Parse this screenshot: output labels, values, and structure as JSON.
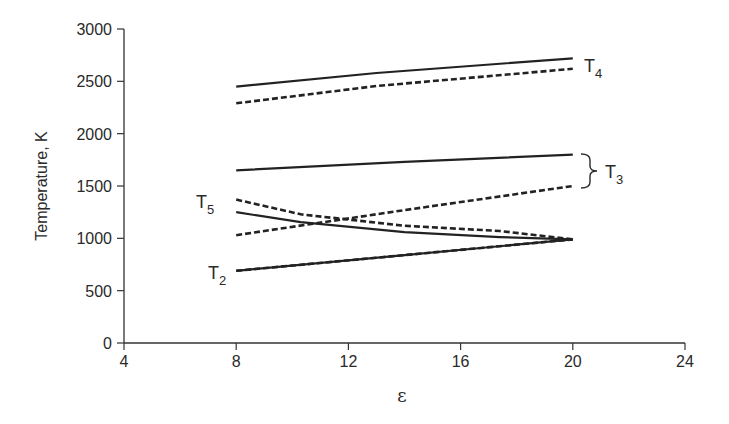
{
  "chart_data": {
    "type": "line",
    "title": "",
    "xlabel": "ε",
    "ylabel": "Temperature, K",
    "xlim": [
      4,
      24
    ],
    "ylim": [
      0,
      3000
    ],
    "xticks": [
      4,
      8,
      12,
      16,
      20,
      24
    ],
    "yticks": [
      0,
      500,
      1000,
      1500,
      2000,
      2500,
      3000
    ],
    "grid": false,
    "legend": "inline labels",
    "series": [
      {
        "name": "T4 (solid)",
        "label": "T",
        "subscript": "4",
        "style": "solid",
        "x": [
          8,
          13,
          20
        ],
        "y": [
          2450,
          2580,
          2720
        ]
      },
      {
        "name": "T4 (dashed)",
        "label": "T",
        "subscript": "4",
        "style": "dashed",
        "x": [
          8,
          13,
          20
        ],
        "y": [
          2290,
          2455,
          2620
        ]
      },
      {
        "name": "T3 (solid)",
        "label": "T",
        "subscript": "3",
        "style": "solid",
        "x": [
          8,
          14,
          20
        ],
        "y": [
          1650,
          1730,
          1800
        ]
      },
      {
        "name": "T3 (dashed)",
        "label": "T",
        "subscript": "3",
        "style": "dashed",
        "x": [
          8,
          14,
          20
        ],
        "y": [
          1030,
          1270,
          1500
        ]
      },
      {
        "name": "T5 (dashed)",
        "label": "T",
        "subscript": "5",
        "style": "dashed",
        "x": [
          8,
          10.3,
          14,
          17.4,
          20
        ],
        "y": [
          1370,
          1230,
          1120,
          1070,
          990
        ]
      },
      {
        "name": "T5 (solid)",
        "label": "T",
        "subscript": "5",
        "style": "solid",
        "x": [
          8,
          10.3,
          14,
          17.4,
          20
        ],
        "y": [
          1250,
          1155,
          1060,
          1012,
          990
        ]
      },
      {
        "name": "T2 (solid)",
        "label": "T",
        "subscript": "2",
        "style": "solid",
        "x": [
          8,
          14,
          20
        ],
        "y": [
          690,
          840,
          990
        ]
      },
      {
        "name": "T2 (dashed)",
        "label": "T",
        "subscript": "2",
        "style": "dashed",
        "x": [
          8,
          14,
          20
        ],
        "y": [
          690,
          840,
          990
        ]
      }
    ],
    "annotations": [
      {
        "text": "T4",
        "near": "right of T4 lines"
      },
      {
        "text": "T3",
        "near": "brace grouping T3 solid and dashed at ε=20"
      },
      {
        "text": "T5",
        "near": "left of T5 lines at ε=8"
      },
      {
        "text": "T2",
        "near": "left of T2 line at ε=8"
      }
    ]
  },
  "labels": {
    "ylabel": "Temperature, K",
    "xlabel": "ε",
    "T4": {
      "main": "T",
      "sub": "4"
    },
    "T3": {
      "main": "T",
      "sub": "3"
    },
    "T5": {
      "main": "T",
      "sub": "5"
    },
    "T2": {
      "main": "T",
      "sub": "2"
    }
  }
}
